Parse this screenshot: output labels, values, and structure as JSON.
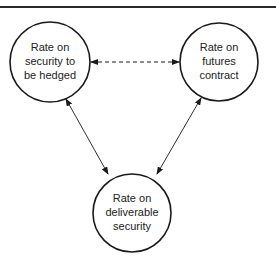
{
  "diagram": {
    "nodes": [
      {
        "id": "security",
        "lines": [
          "Rate on",
          "security to",
          "be hedged"
        ]
      },
      {
        "id": "futures",
        "lines": [
          "Rate on",
          "futures",
          "contract"
        ]
      },
      {
        "id": "deliverable",
        "lines": [
          "Rate on",
          "deliverable",
          "security"
        ]
      }
    ],
    "edges": [
      {
        "from": "security",
        "to": "futures",
        "style": "dashed",
        "direction": "both"
      },
      {
        "from": "security",
        "to": "deliverable",
        "style": "solid",
        "direction": "both"
      },
      {
        "from": "futures",
        "to": "deliverable",
        "style": "solid",
        "direction": "both"
      }
    ],
    "colors": {
      "stroke": "#1a1a1a",
      "text": "#222222",
      "background": "#ffffff"
    }
  }
}
